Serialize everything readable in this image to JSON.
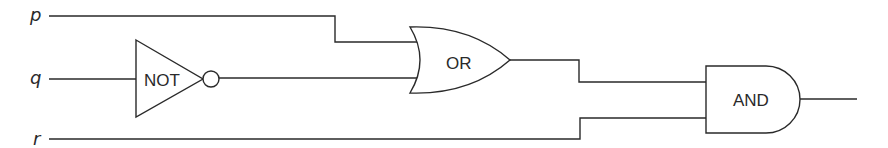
{
  "diagram": {
    "inputs": [
      {
        "label": "p"
      },
      {
        "label": "q"
      },
      {
        "label": "r"
      }
    ],
    "gates": {
      "not": {
        "label": "NOT"
      },
      "or": {
        "label": "OR"
      },
      "and": {
        "label": "AND"
      }
    },
    "connections": [
      {
        "from": "q",
        "to": "NOT"
      },
      {
        "from": "p",
        "to": "OR"
      },
      {
        "from": "NOT",
        "to": "OR"
      },
      {
        "from": "OR",
        "to": "AND"
      },
      {
        "from": "r",
        "to": "AND"
      },
      {
        "from": "AND",
        "to": "output"
      }
    ],
    "colors": {
      "stroke": "#2a2a2a",
      "background": "#ffffff"
    }
  }
}
